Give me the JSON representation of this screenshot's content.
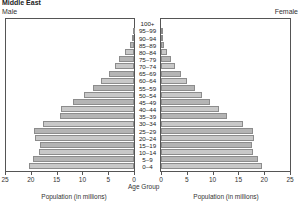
{
  "chart_data": {
    "type": "bar",
    "subtype": "population-pyramid",
    "title": "Middle East",
    "categories": [
      "0–4",
      "5–9",
      "10–14",
      "15–19",
      "20–24",
      "25–29",
      "30–34",
      "35–39",
      "40–44",
      "45–49",
      "50–54",
      "55–59",
      "60–64",
      "65–69",
      "70–74",
      "75–79",
      "80–84",
      "85–89",
      "90–94",
      "95–99",
      "100+"
    ],
    "series": [
      {
        "name": "Male",
        "side": "left",
        "values": [
          20.4,
          19.6,
          18.4,
          18.3,
          19.2,
          19.4,
          17.7,
          14.4,
          14.2,
          11.8,
          9.7,
          8.0,
          6.4,
          4.9,
          3.7,
          2.9,
          1.7,
          0.8,
          0.3,
          0.1,
          0.0
        ]
      },
      {
        "name": "Female",
        "side": "right",
        "values": [
          19.6,
          18.8,
          17.9,
          17.7,
          18.0,
          17.9,
          15.9,
          12.8,
          11.3,
          9.5,
          8.0,
          6.6,
          5.0,
          3.9,
          2.7,
          1.9,
          1.2,
          0.6,
          0.2,
          0.1,
          0.0
        ]
      }
    ],
    "xlabel": "Population (in millions)",
    "ylabel": "Age Group",
    "xlim": [
      0,
      25
    ],
    "xticks": [
      0,
      5,
      10,
      15,
      20,
      25
    ],
    "grid": false,
    "legend": "side labels (Male left, Female right)"
  },
  "labels": {
    "title": "Middle East",
    "male": "Male",
    "female": "Female",
    "age_group": "Age Group",
    "xlabel_left": "Population (in millions)",
    "xlabel_right": "Population (in millions)"
  },
  "ticks_left": [
    "25",
    "20",
    "15",
    "10",
    "5",
    "0"
  ],
  "ticks_right": [
    "0",
    "5",
    "10",
    "15",
    "20",
    "25"
  ],
  "colors": {
    "bar_fill": "#c8c8c8",
    "bar_fill_alt": "#b4b4b4",
    "bar_edge": "#8c8c8c",
    "frame": "#555555"
  }
}
